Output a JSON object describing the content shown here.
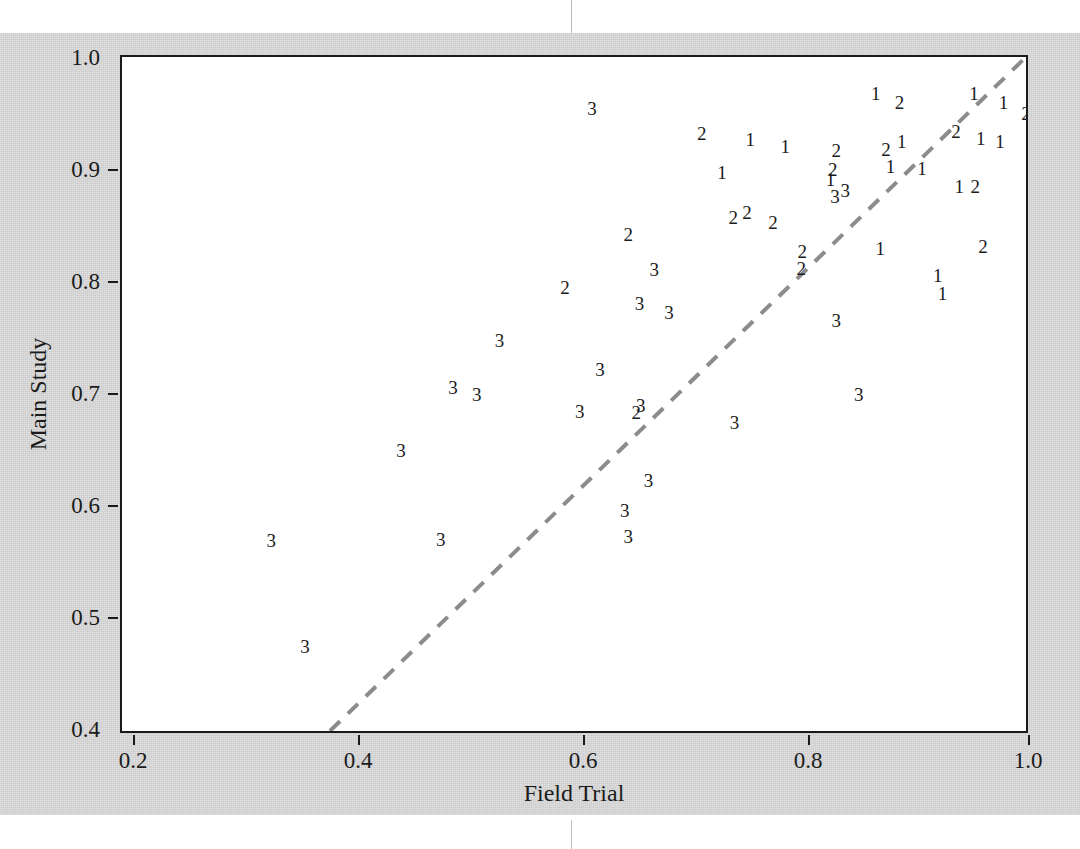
{
  "figure": {
    "background_color": "#cccccc",
    "plot_background_color": "#ffffff",
    "frame_color": "#1a1a1a",
    "marker_color": "#1b1b1b",
    "line_color": "#8c8c8c"
  },
  "chart_data": {
    "type": "scatter",
    "title": "",
    "xlabel": "Field Trial",
    "ylabel": "Main Study",
    "xlim": [
      0.2,
      1.0
    ],
    "ylim": [
      0.4,
      1.0
    ],
    "xticks": [
      "0.2",
      "0.4",
      "0.6",
      "0.8",
      "1.0"
    ],
    "xtick_values": [
      0.2,
      0.4,
      0.6,
      0.8,
      1.0
    ],
    "yticks": [
      "0.4",
      "0.5",
      "0.6",
      "0.7",
      "0.8",
      "0.9",
      "1.0"
    ],
    "ytick_values": [
      0.4,
      0.5,
      0.6,
      0.7,
      0.8,
      0.9,
      1.0
    ],
    "grid": false,
    "legend": "none",
    "marker_style": "group-digit-label",
    "groups": [
      "1",
      "2",
      "3"
    ],
    "reference_line": {
      "style": "dashed",
      "color": "#8c8c8c",
      "x_start": 0.384,
      "y_start": 0.4,
      "x_end": 1.0,
      "y_end": 1.0
    },
    "points": [
      {
        "label": "3",
        "x": 0.616,
        "y": 0.955
      },
      {
        "label": "2",
        "x": 0.713,
        "y": 0.932
      },
      {
        "label": "1",
        "x": 0.756,
        "y": 0.927
      },
      {
        "label": "1",
        "x": 0.787,
        "y": 0.921
      },
      {
        "label": "1",
        "x": 0.867,
        "y": 0.968
      },
      {
        "label": "2",
        "x": 0.888,
        "y": 0.96
      },
      {
        "label": "1",
        "x": 0.954,
        "y": 0.968
      },
      {
        "label": "1",
        "x": 0.98,
        "y": 0.96
      },
      {
        "label": "2",
        "x": 1.0,
        "y": 0.95
      },
      {
        "label": "2",
        "x": 0.938,
        "y": 0.934
      },
      {
        "label": "1",
        "x": 0.96,
        "y": 0.928
      },
      {
        "label": "1",
        "x": 0.977,
        "y": 0.925
      },
      {
        "label": "2",
        "x": 0.832,
        "y": 0.917
      },
      {
        "label": "2",
        "x": 0.876,
        "y": 0.918
      },
      {
        "label": "1",
        "x": 0.89,
        "y": 0.925
      },
      {
        "label": "1",
        "x": 0.88,
        "y": 0.903
      },
      {
        "label": "1",
        "x": 0.908,
        "y": 0.901
      },
      {
        "label": "1",
        "x": 0.731,
        "y": 0.898
      },
      {
        "label": "1",
        "x": 0.827,
        "y": 0.891
      },
      {
        "label": "2",
        "x": 0.829,
        "y": 0.9
      },
      {
        "label": "1",
        "x": 0.941,
        "y": 0.885
      },
      {
        "label": "2",
        "x": 0.955,
        "y": 0.885
      },
      {
        "label": "3",
        "x": 0.831,
        "y": 0.876
      },
      {
        "label": "3",
        "x": 0.84,
        "y": 0.882
      },
      {
        "label": "2",
        "x": 0.741,
        "y": 0.858
      },
      {
        "label": "2",
        "x": 0.753,
        "y": 0.862
      },
      {
        "label": "2",
        "x": 0.776,
        "y": 0.853
      },
      {
        "label": "2",
        "x": 0.648,
        "y": 0.842
      },
      {
        "label": "2",
        "x": 0.802,
        "y": 0.827
      },
      {
        "label": "1",
        "x": 0.871,
        "y": 0.83
      },
      {
        "label": "2",
        "x": 0.962,
        "y": 0.832
      },
      {
        "label": "2",
        "x": 0.801,
        "y": 0.812
      },
      {
        "label": "3",
        "x": 0.671,
        "y": 0.811
      },
      {
        "label": "1",
        "x": 0.922,
        "y": 0.806
      },
      {
        "label": "1",
        "x": 0.926,
        "y": 0.79
      },
      {
        "label": "2",
        "x": 0.592,
        "y": 0.795
      },
      {
        "label": "3",
        "x": 0.658,
        "y": 0.781
      },
      {
        "label": "3",
        "x": 0.684,
        "y": 0.773
      },
      {
        "label": "3",
        "x": 0.832,
        "y": 0.766
      },
      {
        "label": "3",
        "x": 0.534,
        "y": 0.748
      },
      {
        "label": "3",
        "x": 0.623,
        "y": 0.722
      },
      {
        "label": "3",
        "x": 0.493,
        "y": 0.706
      },
      {
        "label": "3",
        "x": 0.514,
        "y": 0.7
      },
      {
        "label": "3",
        "x": 0.852,
        "y": 0.7
      },
      {
        "label": "3",
        "x": 0.605,
        "y": 0.685
      },
      {
        "label": "2",
        "x": 0.655,
        "y": 0.684
      },
      {
        "label": "3",
        "x": 0.659,
        "y": 0.69
      },
      {
        "label": "3",
        "x": 0.742,
        "y": 0.675
      },
      {
        "label": "3",
        "x": 0.447,
        "y": 0.65
      },
      {
        "label": "3",
        "x": 0.666,
        "y": 0.623
      },
      {
        "label": "3",
        "x": 0.645,
        "y": 0.597
      },
      {
        "label": "3",
        "x": 0.648,
        "y": 0.574
      },
      {
        "label": "3",
        "x": 0.332,
        "y": 0.57
      },
      {
        "label": "3",
        "x": 0.482,
        "y": 0.571
      },
      {
        "label": "3",
        "x": 0.362,
        "y": 0.476
      }
    ]
  }
}
